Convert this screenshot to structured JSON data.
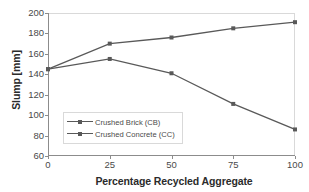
{
  "chart_data": {
    "type": "line",
    "title": "",
    "xlabel": "Percentage Recycled Aggregate",
    "ylabel": "Slump [mm]",
    "x": [
      0,
      25,
      50,
      75,
      100
    ],
    "xticklabels": [
      "0",
      "25",
      "50",
      "75",
      "100"
    ],
    "yticklabels": [
      "60",
      "80",
      "100",
      "120",
      "140",
      "160",
      "180",
      "200"
    ],
    "yticks": [
      60,
      80,
      100,
      120,
      140,
      160,
      180,
      200
    ],
    "xlim": [
      0,
      100
    ],
    "ylim": [
      60,
      200
    ],
    "grid": false,
    "legend_position": "center-left",
    "series": [
      {
        "name": "Crushed Brick (CB)",
        "values": [
          145,
          155,
          141,
          111,
          86
        ],
        "color": "#595959",
        "marker": "square"
      },
      {
        "name": "Crushed Concrete (CC)",
        "values": [
          145,
          170,
          176,
          185,
          191
        ],
        "color": "#595959",
        "marker": "square"
      }
    ]
  },
  "legend": {
    "items": [
      {
        "label": "Crushed Brick (CB)"
      },
      {
        "label": "Crushed Concrete (CC)"
      }
    ]
  },
  "colors": {
    "line": "#595959",
    "axis": "#8c8c8c",
    "border": "#d9d9d9",
    "text": "#3b3b3b",
    "background": "#ffffff"
  }
}
